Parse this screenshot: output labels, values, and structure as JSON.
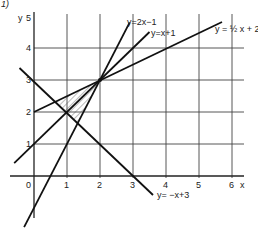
{
  "figure": {
    "label": "1)",
    "x_axis_label": "x",
    "y_axis_label": "y",
    "x_ticks": [
      "0",
      "1",
      "2",
      "3",
      "4",
      "5",
      "6"
    ],
    "y_ticks": [
      "1",
      "2",
      "3",
      "4",
      "5"
    ],
    "lines": [
      {
        "name": "line-2x-minus-1",
        "label": "y=2x−1",
        "slope": 2,
        "intercept": -1
      },
      {
        "name": "line-x-plus-1",
        "label": "y=x+1",
        "slope": 1,
        "intercept": 1
      },
      {
        "name": "line-half-x-plus-2",
        "label": "y = ½ x + 2",
        "slope": 0.5,
        "intercept": 2
      },
      {
        "name": "line-neg-x-plus-3",
        "label": "y= −x+3",
        "slope": -1,
        "intercept": 3
      }
    ],
    "shaded_region": {
      "vertices": [
        [
          0.667,
          2.333
        ],
        [
          1.333,
          1.667
        ],
        [
          2,
          3
        ]
      ],
      "style": "hatched"
    },
    "intersection_point": [
      2,
      3
    ]
  }
}
